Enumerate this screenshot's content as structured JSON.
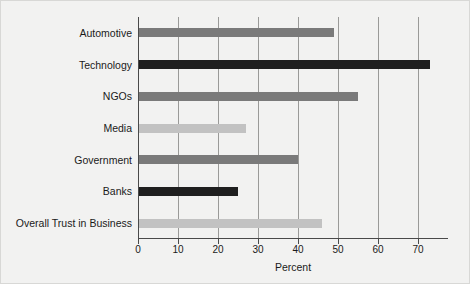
{
  "chart_data": {
    "type": "bar",
    "orientation": "horizontal",
    "title": "",
    "xlabel": "Percent",
    "ylabel": "",
    "categories": [
      "Automotive",
      "Technology",
      "NGOs",
      "Media",
      "Government",
      "Banks",
      "Overall Trust in Business"
    ],
    "values": [
      49,
      73,
      55,
      27,
      40,
      25,
      46
    ],
    "bar_colors": [
      "#7a7a7a",
      "#1f1f1f",
      "#7a7a7a",
      "#c2c2c2",
      "#7a7a7a",
      "#1f1f1f",
      "#c2c2c2"
    ],
    "xlim": [
      0,
      77.5
    ],
    "xticks": [
      0,
      10,
      20,
      30,
      40,
      50,
      60,
      70
    ],
    "xtick_labels": [
      "0",
      "10",
      "20",
      "30",
      "40",
      "50",
      "60",
      "70"
    ],
    "grid": "vertical",
    "legend": "none",
    "background": "#f2f2f1",
    "axis_color": "#4a4a4a",
    "gridline_color": "#9a9a98"
  }
}
